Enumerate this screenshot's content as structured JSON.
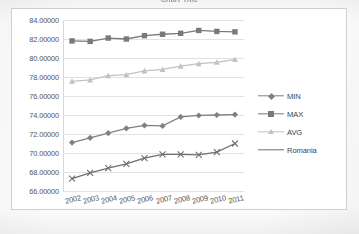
{
  "title": "Chart Title",
  "colors": {
    "min": "#808080",
    "max": "#7a7a7a",
    "avg": "#c2c2c2",
    "romania": "#6f6f6f",
    "grid": "#e2e2e2",
    "axis_text": "#555555",
    "frame": "#cfcfcf"
  },
  "legend": {
    "position": "right",
    "items": [
      {
        "label": "MIN",
        "marker": "diamond",
        "color": "#808080"
      },
      {
        "label": "MAX",
        "marker": "square",
        "color": "#7a7a7a"
      },
      {
        "label": "AVG",
        "marker": "triangle",
        "color": "#c2c2c2"
      },
      {
        "label": "Romania",
        "marker": "none",
        "color": "#6f6f6f"
      }
    ]
  },
  "yaxis": {
    "ticks": [
      "84.00000",
      "82.00000",
      "80.00000",
      "78.00000",
      "76.00000",
      "74.00000",
      "72.00000",
      "70.00000",
      "68.00000",
      "66.00000"
    ],
    "min": 66,
    "max": 84,
    "step": 2
  },
  "chart_data": {
    "type": "line",
    "title": "Chart Title",
    "xlabel": "",
    "ylabel": "",
    "ylim": [
      66,
      84
    ],
    "grid": true,
    "legend_position": "right",
    "categories": [
      "2002",
      "2003",
      "2004",
      "2005",
      "2006",
      "2007",
      "2008",
      "2009",
      "2010",
      "2011"
    ],
    "series": [
      {
        "name": "MIN",
        "marker": "diamond",
        "color": "#808080",
        "values": [
          71.1,
          71.6,
          72.1,
          72.6,
          72.9,
          72.85,
          73.8,
          73.95,
          74.0,
          74.05
        ]
      },
      {
        "name": "MAX",
        "marker": "square",
        "color": "#7a7a7a",
        "values": [
          81.8,
          81.75,
          82.1,
          82.0,
          82.35,
          82.5,
          82.6,
          82.9,
          82.8,
          82.75
        ]
      },
      {
        "name": "AVG",
        "marker": "triangle",
        "color": "#c2c2c2",
        "values": [
          77.55,
          77.7,
          78.15,
          78.25,
          78.65,
          78.8,
          79.15,
          79.4,
          79.55,
          79.85
        ]
      },
      {
        "name": "Romania",
        "marker": "x",
        "color": "#6f6f6f",
        "values": [
          67.3,
          67.9,
          68.4,
          68.85,
          69.45,
          69.85,
          69.85,
          69.8,
          70.1,
          71.0
        ]
      }
    ]
  }
}
